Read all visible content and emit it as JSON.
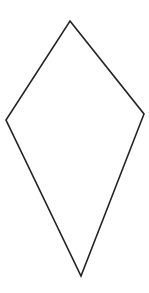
{
  "diagram": {
    "shape": "kite",
    "background": "#ffffff",
    "stroke_color": "#222222",
    "stroke_width": 1.6,
    "fill": "none",
    "vertices": [
      {
        "name": "top",
        "x": 70,
        "y": 21
      },
      {
        "name": "right",
        "x": 144,
        "y": 114
      },
      {
        "name": "bottom",
        "x": 81,
        "y": 276
      },
      {
        "name": "left",
        "x": 6,
        "y": 120
      }
    ]
  }
}
